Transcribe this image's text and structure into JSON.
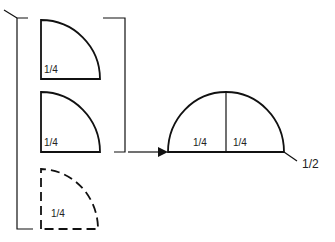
{
  "diagram": {
    "title": "",
    "left_group": {
      "pieces": [
        {
          "id": "quarter-1",
          "label": "1/4",
          "style": "solid"
        },
        {
          "id": "quarter-2",
          "label": "1/4",
          "style": "solid"
        },
        {
          "id": "quarter-3",
          "label": "1/4",
          "style": "dashed"
        }
      ]
    },
    "result": {
      "left_label": "1/4",
      "right_label": "1/4",
      "total_label": "1/2"
    },
    "colors": {
      "stroke": "#111111",
      "background": "#ffffff"
    }
  }
}
